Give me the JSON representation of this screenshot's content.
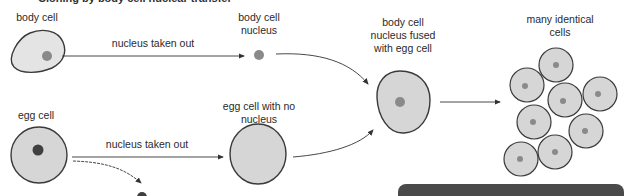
{
  "diagram": {
    "title_cropped": "Cloning by body cell nuclear transfer",
    "labels": {
      "body_cell": "body cell",
      "nucleus_taken_out_top": "nucleus taken out",
      "body_cell_nucleus_1": "body cell",
      "body_cell_nucleus_2": "nucleus",
      "fused_1": "body cell",
      "fused_2": "nucleus fused",
      "fused_3": "with egg cell",
      "many_1": "many identical",
      "many_2": "cells",
      "egg_cell": "egg cell",
      "nucleus_taken_out_bottom": "nucleus taken out",
      "egg_no_nucleus_1": "egg cell with no",
      "egg_no_nucleus_2": "nucleus"
    },
    "colors": {
      "cell_fill": "#d6d6d6",
      "cell_light_fill": "#e4e4e4",
      "cell_stroke": "#3a3a3a",
      "body_nucleus": "#8a8a8a",
      "egg_nucleus": "#404040",
      "arrow": "#333333",
      "dark_bar": "#4a4a4a"
    }
  }
}
